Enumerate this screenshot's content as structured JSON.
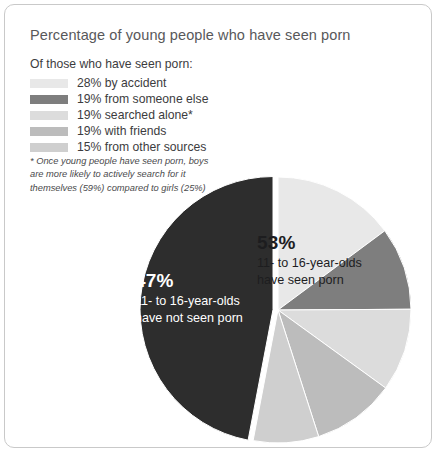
{
  "card": {
    "title": "Percentage of young people who have seen porn",
    "legend_heading": "Of those who have seen porn:",
    "footnote": "* Once young people have seen porn, boys are more likely to actively search for it themselves (59%) compared to girls (25%)"
  },
  "legend": {
    "items": [
      {
        "label": "28% by accident",
        "value": 28,
        "color": "#e8e8e8"
      },
      {
        "label": "19% from someone else",
        "value": 19,
        "color": "#7e7e7e"
      },
      {
        "label": "19% searched alone*",
        "value": 19,
        "color": "#dcdcdc"
      },
      {
        "label": "19% with friends",
        "value": 19,
        "color": "#bcbcbc"
      },
      {
        "label": "15% from other sources",
        "value": 15,
        "color": "#cfcfcf"
      }
    ]
  },
  "callouts": {
    "seen": {
      "percent": "53%",
      "line1": "11- to 16-year-olds",
      "line2": "have seen porn"
    },
    "not_seen": {
      "percent": "47%",
      "line1": "11- to 16-year-olds",
      "line2": "have not seen porn"
    }
  },
  "chart_data": {
    "type": "pie",
    "title": "Percentage of young people who have seen porn",
    "legend_position": "top-left",
    "grid": false,
    "total": 100,
    "slices": [
      {
        "label": "11- to 16-year-olds have seen porn",
        "value": 53,
        "color": "#c4c4c4",
        "exploded": false
      },
      {
        "label": "11- to 16-year-olds have not seen porn",
        "value": 47,
        "color": "#2d2d2d",
        "exploded": true
      }
    ],
    "breakdown_of": "11- to 16-year-olds have seen porn",
    "breakdown": [
      {
        "label": "28% by accident",
        "value": 28,
        "color": "#e8e8e8"
      },
      {
        "label": "19% from someone else",
        "value": 19,
        "color": "#7e7e7e"
      },
      {
        "label": "19% searched alone*",
        "value": 19,
        "color": "#dcdcdc"
      },
      {
        "label": "19% with friends",
        "value": 19,
        "color": "#bcbcbc"
      },
      {
        "label": "15% from other sources",
        "value": 15,
        "color": "#cfcfcf"
      }
    ],
    "annotations": [
      "53% 11- to 16-year-olds have seen porn",
      "47% 11- to 16-year-olds have not seen porn",
      "* Once young people have seen porn, boys are more likely to actively search for it themselves (59%) compared to girls (25%)"
    ]
  }
}
